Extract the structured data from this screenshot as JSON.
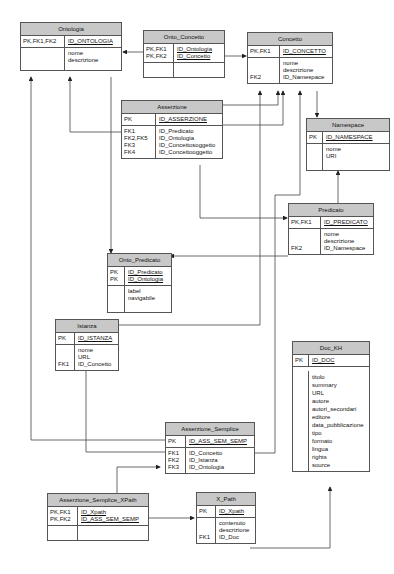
{
  "diagram": {
    "type": "er-diagram",
    "entities": [
      {
        "name": "Ontologia",
        "pk": [
          {
            "key": "PK,FK1,FK2",
            "field": "ID_ONTOLOGIA"
          }
        ],
        "attributes": [
          {
            "key": "",
            "field": "nome"
          },
          {
            "key": "",
            "field": "descrizione"
          }
        ]
      },
      {
        "name": "Onto_Concetto",
        "pk": [
          {
            "key": "PK,FK1",
            "field": "ID_Ontologia"
          },
          {
            "key": "PK,FK2",
            "field": "ID_Concetto"
          }
        ],
        "attributes": []
      },
      {
        "name": "Concetto",
        "pk": [
          {
            "key": "PK,FK1",
            "field": "ID_CONCETTO"
          }
        ],
        "attributes": [
          {
            "key": "",
            "field": "nome"
          },
          {
            "key": "",
            "field": "descrizione"
          },
          {
            "key": "FK2",
            "field": "ID_Namespace"
          }
        ]
      },
      {
        "name": "Asserzione",
        "pk": [
          {
            "key": "PK",
            "field": "ID_ASSERZIONE"
          }
        ],
        "attributes": [
          {
            "key": "FK1",
            "field": "ID_Predicato"
          },
          {
            "key": "FK2,FK5",
            "field": "ID_Ontologia"
          },
          {
            "key": "FK3",
            "field": "ID_Concettosoggetto"
          },
          {
            "key": "FK4",
            "field": "ID_Concettooggetto"
          }
        ]
      },
      {
        "name": "Namespace",
        "pk": [
          {
            "key": "PK",
            "field": "ID_NAMESPACE"
          }
        ],
        "attributes": [
          {
            "key": "",
            "field": "nome"
          },
          {
            "key": "",
            "field": "URI"
          }
        ]
      },
      {
        "name": "Predicato",
        "pk": [
          {
            "key": "PK,FK1",
            "field": "ID_PREDICATO"
          }
        ],
        "attributes": [
          {
            "key": "",
            "field": "nome"
          },
          {
            "key": "",
            "field": "descrizione"
          },
          {
            "key": "FK2",
            "field": "ID_Namespace"
          }
        ]
      },
      {
        "name": "Onto_Predicato",
        "pk": [
          {
            "key": "PK",
            "field": "ID_Predicato"
          },
          {
            "key": "PK",
            "field": "ID_Ontologia"
          }
        ],
        "attributes": [
          {
            "key": "",
            "field": "label"
          },
          {
            "key": "",
            "field": "navigabile"
          }
        ]
      },
      {
        "name": "Istanza",
        "pk": [
          {
            "key": "PK",
            "field": "ID_ISTANZA"
          }
        ],
        "attributes": [
          {
            "key": "",
            "field": "nome"
          },
          {
            "key": "",
            "field": "URL"
          },
          {
            "key": "FK1",
            "field": "ID_Concetto"
          }
        ]
      },
      {
        "name": "Doc_KH",
        "pk": [
          {
            "key": "PK",
            "field": "ID_DOC"
          }
        ],
        "attributes": [
          {
            "key": "",
            "field": "titolo"
          },
          {
            "key": "",
            "field": "summary"
          },
          {
            "key": "",
            "field": "URL"
          },
          {
            "key": "",
            "field": "autore"
          },
          {
            "key": "",
            "field": "autori_secondari"
          },
          {
            "key": "",
            "field": "editore"
          },
          {
            "key": "",
            "field": "data_pubblicazione"
          },
          {
            "key": "",
            "field": "tipo"
          },
          {
            "key": "",
            "field": "formato"
          },
          {
            "key": "",
            "field": "lingua"
          },
          {
            "key": "",
            "field": "rights"
          },
          {
            "key": "",
            "field": "source"
          }
        ]
      },
      {
        "name": "Asserzione_Semplice",
        "pk": [
          {
            "key": "PK",
            "field": "ID_ASS_SEM_SEMP"
          }
        ],
        "attributes": [
          {
            "key": "FK1",
            "field": "ID_Concetto"
          },
          {
            "key": "FK2",
            "field": "ID_Istanza"
          },
          {
            "key": "FK3",
            "field": "ID_Ontologia"
          }
        ]
      },
      {
        "name": "Asserzione_Semplice_XPath",
        "pk": [
          {
            "key": "PK,FK1",
            "field": "ID_Xpath"
          },
          {
            "key": "PK,FK2",
            "field": "ID_ASS_SEM_SEMP"
          }
        ],
        "attributes": []
      },
      {
        "name": "X_Path",
        "pk": [
          {
            "key": "PK",
            "field": "ID_Xpath"
          }
        ],
        "attributes": [
          {
            "key": "",
            "field": "contenuto"
          },
          {
            "key": "",
            "field": "descrizione"
          },
          {
            "key": "FK1",
            "field": "ID_Doc"
          }
        ]
      }
    ],
    "relationships": [
      {
        "from": "Onto_Concetto",
        "to": "Ontologia"
      },
      {
        "from": "Onto_Concetto",
        "to": "Concetto"
      },
      {
        "from": "Concetto",
        "to": "Namespace"
      },
      {
        "from": "Asserzione",
        "to": "Ontologia"
      },
      {
        "from": "Asserzione",
        "to": "Concetto"
      },
      {
        "from": "Asserzione",
        "to": "Predicato"
      },
      {
        "from": "Predicato",
        "to": "Namespace"
      },
      {
        "from": "Predicato",
        "to": "Onto_Predicato"
      },
      {
        "from": "Ontologia",
        "to": "Onto_Predicato"
      },
      {
        "from": "Istanza",
        "to": "Concetto"
      },
      {
        "from": "Asserzione_Semplice",
        "to": "Ontologia"
      },
      {
        "from": "Asserzione_Semplice",
        "to": "Istanza"
      },
      {
        "from": "Asserzione_Semplice",
        "to": "Concetto"
      },
      {
        "from": "Asserzione_Semplice_XPath",
        "to": "Asserzione_Semplice"
      },
      {
        "from": "Asserzione_Semplice_XPath",
        "to": "X_Path"
      },
      {
        "from": "X_Path",
        "to": "Doc_KH"
      }
    ]
  },
  "e": {
    "ontologia": {
      "title": "Ontologia",
      "pk_keys": "PK,FK1,FK2",
      "pk_fields": "ID_ONTOLOGIA",
      "keys": "",
      "fields": "nome\ndescrizione"
    },
    "onto_concetto": {
      "title": "Onto_Concetto",
      "pk_keys": "PK,FK1\nPK,FK2",
      "pk_fields": "ID_Ontologia\nID_Concetto",
      "keys": "",
      "fields": ""
    },
    "concetto": {
      "title": "Concetto",
      "pk_keys": "PK,FK1",
      "pk_fields": "ID_CONCETTO",
      "keys": "\n\nFK2",
      "fields": "nome\ndescrizione\nID_Namespace"
    },
    "asserzione": {
      "title": "Asserzione",
      "pk_keys": "PK",
      "pk_fields": "ID_ASSERZIONE",
      "keys": "FK1\nFK2,FK5\nFK3\nFK4",
      "fields": "ID_Predicato\nID_Ontologia\nID_Concettosoggetto\nID_Concettooggetto"
    },
    "namespace": {
      "title": "Namespace",
      "pk_keys": "PK",
      "pk_fields": "ID_NAMESPACE",
      "keys": "",
      "fields": "nome\nURI"
    },
    "predicato": {
      "title": "Predicato",
      "pk_keys": "PK,FK1",
      "pk_fields": "ID_PREDICATO",
      "keys": "\n\nFK2",
      "fields": "nome\ndescrizione\nID_Namespace"
    },
    "onto_predicato": {
      "title": "Onto_Predicato",
      "pk_keys": "PK\nPK",
      "pk_fields": "ID_Predicato\nID_Ontologia",
      "keys": "",
      "fields": "label\nnavigabile"
    },
    "istanza": {
      "title": "Istanza",
      "pk_keys": "PK",
      "pk_fields": "ID_ISTANZA",
      "keys": "\n\nFK1",
      "fields": "nome\nURL\nID_Concetto"
    },
    "doc_kh": {
      "title": "Doc_KH",
      "pk_keys": "PK",
      "pk_fields": "ID_DOC",
      "keys": "",
      "fields": "titolo\nsummary\nURL\nautore\nautori_secondari\neditore\ndata_pubblicazione\ntipo\nformato\nlingua\nrights\nsource"
    },
    "asserzione_semplice": {
      "title": "Asserzione_Semplice",
      "pk_keys": "PK",
      "pk_fields": "ID_ASS_SEM_SEMP",
      "keys": "FK1\nFK2\nFK3",
      "fields": "ID_Concetto\nID_Istanza\nID_Ontologia"
    },
    "asserzione_semplice_xpath": {
      "title": "Asserzione_Semplice_XPath",
      "pk_keys": "PK,FK1\nPK,FK2",
      "pk_fields": "ID_Xpath\nID_ASS_SEM_SEMP",
      "keys": "",
      "fields": ""
    },
    "x_path": {
      "title": "X_Path",
      "pk_keys": "PK",
      "pk_fields": "ID_Xpath",
      "keys": "\n\nFK1",
      "fields": "contenuto\ndescrizione\nID_Doc"
    }
  },
  "colors": {
    "header_fill": "#c8c8c8",
    "border": "#555555",
    "line": "#333333"
  }
}
